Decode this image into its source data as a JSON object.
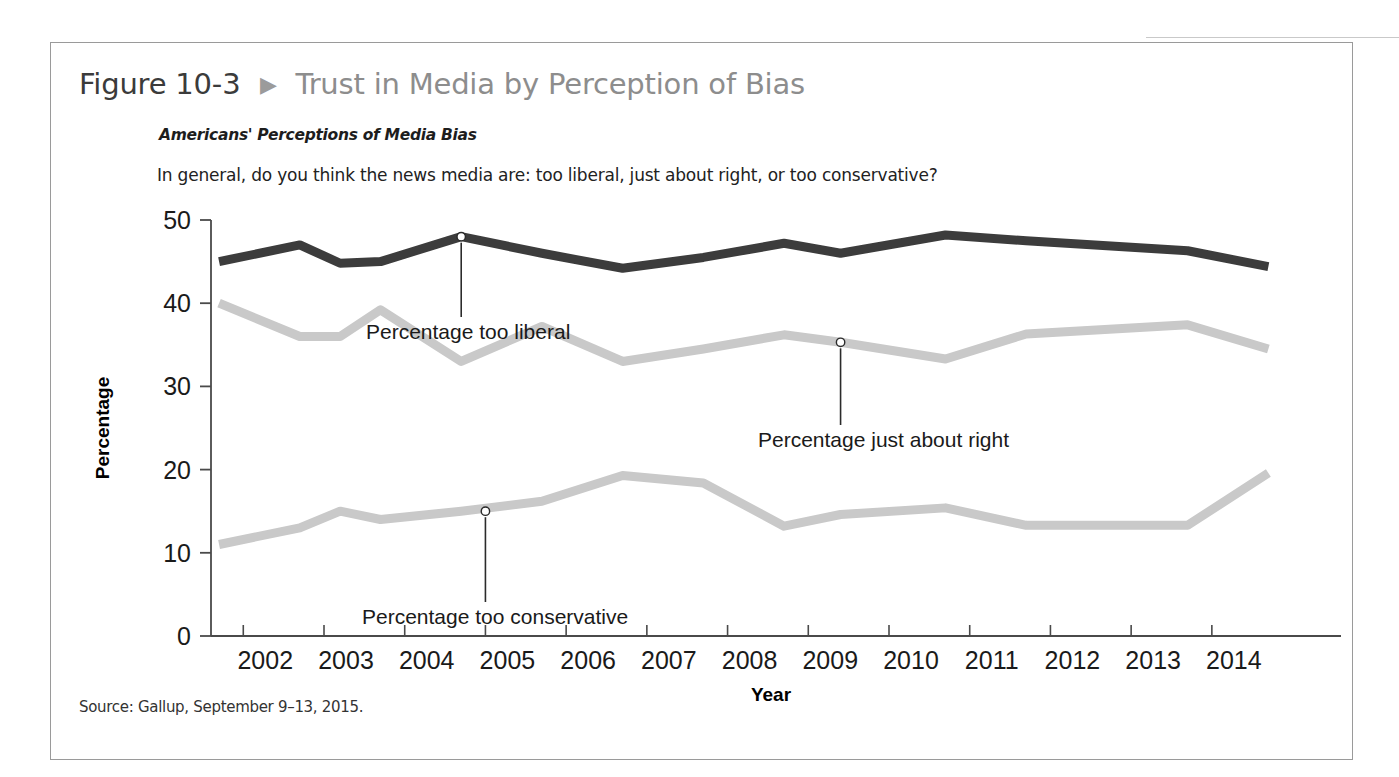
{
  "figure": {
    "number": "Figure 10-3",
    "arrow_icon": "triangle-right-icon",
    "title": "Trust in Media by Perception of Bias",
    "subtitle": "Americans' Perceptions of Media Bias",
    "question": "In general, do you think the news media are: too liberal, just about right, or too conservative?",
    "source": "Source: Gallup, September 9–13, 2015."
  },
  "chart_data": {
    "type": "line",
    "title": "Americans' Perceptions of Media Bias",
    "subtitle": "In general, do you think the news media are: too liberal, just about right, or too conservative?",
    "xlabel": "Year",
    "ylabel": "Percentage",
    "xlim": [
      2001.6,
      2015.6
    ],
    "ylim": [
      0,
      50
    ],
    "yticks": [
      0,
      10,
      20,
      30,
      40,
      50
    ],
    "ytick_labels": [
      "0",
      "10",
      "20",
      "30",
      "40",
      "50"
    ],
    "xticks": [
      2002,
      2003,
      2004,
      2005,
      2006,
      2007,
      2008,
      2009,
      2010,
      2011,
      2012,
      2013,
      2014
    ],
    "xtick_labels": [
      "2002",
      "2003",
      "2004",
      "2005",
      "2006",
      "2007",
      "2008",
      "2009",
      "2010",
      "2011",
      "2012",
      "2013",
      "2014"
    ],
    "grid": false,
    "legend": "inline-annotations",
    "x": [
      2001.7,
      2002.7,
      2003.2,
      2003.7,
      2004.7,
      2005.7,
      2006.7,
      2007.7,
      2008.7,
      2009.4,
      2010.7,
      2011.7,
      2013.7,
      2014.7
    ],
    "series": [
      {
        "name": "Percentage too liberal",
        "color": "#3c3c3c",
        "values": [
          45,
          47,
          44.8,
          45,
          48,
          46,
          44.2,
          45.5,
          47.2,
          46,
          48.2,
          47.5,
          46.3,
          44.4
        ]
      },
      {
        "name": "Percentage just about right",
        "color": "#c9c9c9",
        "values": [
          40,
          36,
          36,
          39.2,
          33,
          37.2,
          33,
          34.5,
          36.2,
          35.3,
          33.3,
          36.3,
          37.4,
          34.5
        ]
      },
      {
        "name": "Percentage too conservative",
        "color": "#c9c9c9",
        "values": [
          11,
          13,
          15,
          14,
          15,
          16.2,
          19.3,
          18.4,
          13.2,
          14.6,
          15.4,
          13.3,
          13.3,
          19.6
        ]
      }
    ],
    "annotations": [
      {
        "label": "Percentage too liberal",
        "marker_x": 2004.7,
        "marker_y": 48,
        "text_x": 315,
        "text_y": 296
      },
      {
        "label": "Percentage just about right",
        "marker_x": 2009.4,
        "marker_y": 35.3,
        "text_x": 707,
        "text_y": 404
      },
      {
        "label": "Percentage too conservative",
        "marker_x": 2005.0,
        "marker_y": 15.0,
        "text_x": 311,
        "text_y": 581
      }
    ]
  }
}
